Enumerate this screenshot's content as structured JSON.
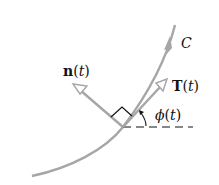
{
  "diagram": {
    "curve_label": "C",
    "normal_label": {
      "bold": "n",
      "paren_open": "(",
      "var": "t",
      "paren_close": ")"
    },
    "tangent_label": {
      "bold": "T",
      "paren_open": "(",
      "var": "t",
      "paren_close": ")"
    },
    "angle_label": {
      "symbol": "ϕ",
      "paren_open": "(",
      "var": "t",
      "paren_close": ")"
    },
    "colors": {
      "curve": "#a6a6a6",
      "vector": "#a6a6a6",
      "text": "#111111",
      "dash": "#111111"
    }
  }
}
